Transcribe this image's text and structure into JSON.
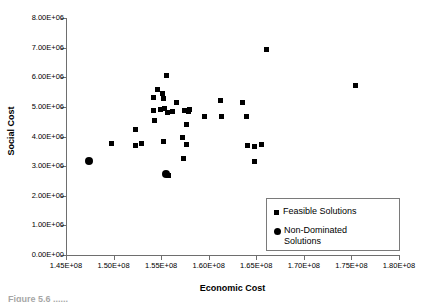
{
  "figure": {
    "caption_partial": "Figure 5.6 ......"
  },
  "chart_data": {
    "type": "scatter",
    "title": "",
    "xlabel": "Economic Cost",
    "ylabel": "Social Cost",
    "xlim": [
      145000000,
      180000000
    ],
    "ylim": [
      0,
      8000000
    ],
    "grid": false,
    "legend_position": "bottom-right",
    "xticks": [
      145000000,
      150000000,
      155000000,
      160000000,
      165000000,
      170000000,
      175000000,
      180000000
    ],
    "xticklabels": [
      "1.45E+08",
      "1.50E+08",
      "1.55E+08",
      "1.60E+08",
      "1.65E+08",
      "1.70E+08",
      "1.75E+08",
      "1.80E+08"
    ],
    "yticks": [
      0,
      1000000,
      2000000,
      3000000,
      4000000,
      5000000,
      6000000,
      7000000,
      8000000
    ],
    "yticklabels": [
      "0.00E+00",
      "1.00E+06",
      "2.00E+06",
      "3.00E+06",
      "4.00E+06",
      "5.00E+06",
      "6.00E+06",
      "7.00E+06",
      "8.00E+06"
    ],
    "series": [
      {
        "name": "Feasible Solutions",
        "marker": "square",
        "color": "#000000",
        "points": [
          [
            152300000,
            4230000
          ],
          [
            152300000,
            3700000
          ],
          [
            154600000,
            5600000
          ],
          [
            155600000,
            6070000
          ],
          [
            155100000,
            5450000
          ],
          [
            154200000,
            5300000
          ],
          [
            155200000,
            5280000
          ],
          [
            156600000,
            5150000
          ],
          [
            154200000,
            4870000
          ],
          [
            154900000,
            4900000
          ],
          [
            155400000,
            4950000
          ],
          [
            155700000,
            4820000
          ],
          [
            156200000,
            4840000
          ],
          [
            154300000,
            4530000
          ],
          [
            157500000,
            4880000
          ],
          [
            157900000,
            4830000
          ],
          [
            158000000,
            4900000
          ],
          [
            157700000,
            4400000
          ],
          [
            159600000,
            4680000
          ],
          [
            161200000,
            5200000
          ],
          [
            161300000,
            4660000
          ],
          [
            163600000,
            5160000
          ],
          [
            164000000,
            4680000
          ],
          [
            155800000,
            2700000
          ],
          [
            157200000,
            3950000
          ],
          [
            157700000,
            3740000
          ],
          [
            157400000,
            3250000
          ],
          [
            155200000,
            3820000
          ],
          [
            152900000,
            3760000
          ],
          [
            149800000,
            3770000
          ],
          [
            164100000,
            3700000
          ],
          [
            164800000,
            3650000
          ],
          [
            165600000,
            3740000
          ],
          [
            164800000,
            3150000
          ],
          [
            166100000,
            6950000
          ],
          [
            175400000,
            5720000
          ]
        ]
      },
      {
        "name": "Non-Dominated Solutions",
        "marker": "circle",
        "color": "#000000",
        "points": [
          [
            147400000,
            3180000
          ],
          [
            155500000,
            2740000
          ]
        ]
      }
    ]
  },
  "legend": {
    "items": [
      {
        "label": "Feasible Solutions",
        "marker": "square"
      },
      {
        "label": "Non-Dominated\nSolutions",
        "marker": "circle"
      }
    ]
  }
}
